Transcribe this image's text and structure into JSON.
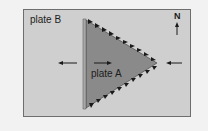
{
  "diagram": {
    "labels": {
      "plate_b": "plate B",
      "plate_a": "plate A",
      "north": "N"
    },
    "icons": {
      "north_arrow": "arrow-up",
      "left_arrow": "arrow-left",
      "inner_arrow": "arrow-right",
      "right_arrow": "arrow-left"
    },
    "colors": {
      "background": "#f2f2f2",
      "plate_b_fill": "#cfcfcf",
      "plate_a_fill": "#8a8a8a",
      "ridge_edge": "#a8a8a8",
      "teeth": "#1a1a1a",
      "frame_border": "#6e6e6e"
    }
  }
}
